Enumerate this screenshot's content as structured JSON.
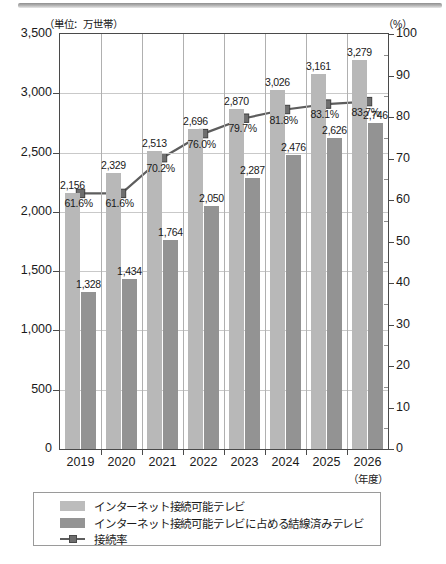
{
  "chart_data": {
    "type": "bar",
    "title": "",
    "unit_left": "（単位：万世帯）",
    "unit_right": "（%）",
    "xlabel": "（年度）",
    "ylabel": "",
    "categories": [
      "2019",
      "2020",
      "2021",
      "2022",
      "2023",
      "2024",
      "2025",
      "2026"
    ],
    "ylim": [
      0,
      3500
    ],
    "y2lim": [
      0,
      100
    ],
    "yticks": [
      "0",
      "500",
      "1,000",
      "1,500",
      "2,000",
      "2,500",
      "3,000",
      "3,500"
    ],
    "ytick_values": [
      0,
      500,
      1000,
      1500,
      2000,
      2500,
      3000,
      3500
    ],
    "y2ticks": [
      "0",
      "10",
      "20",
      "30",
      "40",
      "50",
      "60",
      "70",
      "80",
      "90",
      "100"
    ],
    "y2tick_values": [
      0,
      10,
      20,
      30,
      40,
      50,
      60,
      70,
      80,
      90,
      100
    ],
    "grid": true,
    "legend_position": "bottom",
    "series": [
      {
        "name": "インターネット接続可能テレビ",
        "kind": "bar",
        "color": "#b8b8b8",
        "axis": "left",
        "values": [
          2156,
          2329,
          2513,
          2696,
          2870,
          3026,
          3161,
          3279
        ],
        "labels": [
          "2,156",
          "2,329",
          "2,513",
          "2,696",
          "2,870",
          "3,026",
          "3,161",
          "3,279"
        ]
      },
      {
        "name": "インターネット接続可能テレビに占める結線済みテレビ",
        "kind": "bar",
        "color": "#939393",
        "axis": "left",
        "values": [
          1328,
          1434,
          1764,
          2050,
          2287,
          2476,
          2626,
          2746
        ],
        "labels": [
          "1,328",
          "1,434",
          "1,764",
          "2,050",
          "2,287",
          "2,476",
          "2,626",
          "2,746"
        ]
      },
      {
        "name": "接続率",
        "kind": "line",
        "color": "#5d5d5d",
        "axis": "right",
        "values": [
          61.6,
          61.6,
          70.2,
          76.0,
          79.7,
          81.8,
          83.1,
          83.7
        ],
        "labels": [
          "61.6%",
          "61.6%",
          "70.2%",
          "76.0%",
          "79.7%",
          "81.8%",
          "83.1%",
          "83.7%"
        ]
      }
    ]
  },
  "legend": {
    "items": [
      {
        "label": "インターネット接続可能テレビ",
        "swatch": "light"
      },
      {
        "label": "インターネット接続可能テレビに占める結線済みテレビ",
        "swatch": "dark"
      },
      {
        "label": "接続率",
        "swatch": "line"
      }
    ]
  }
}
